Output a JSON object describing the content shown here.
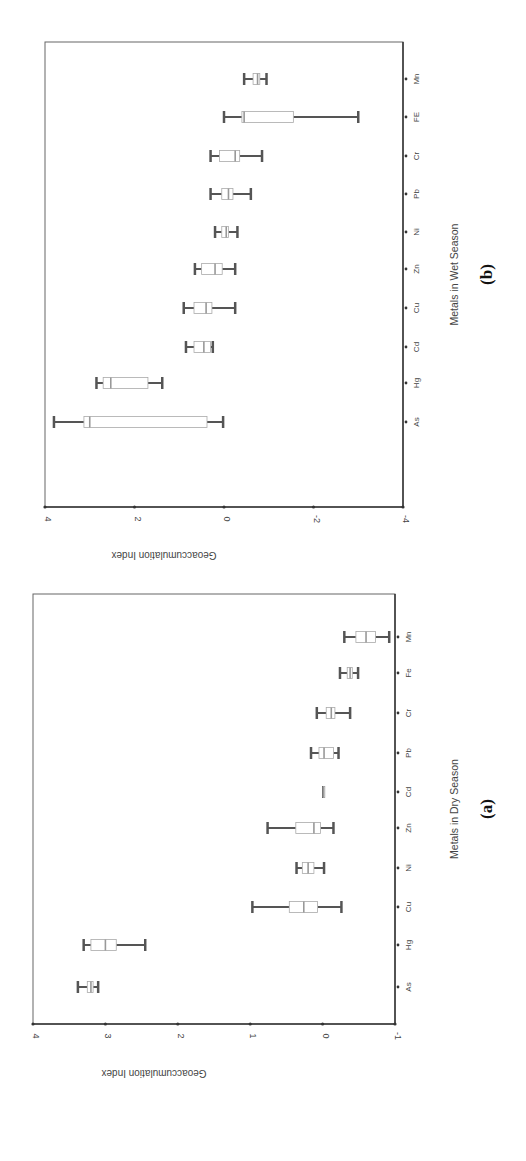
{
  "chart_data": [
    {
      "type": "box",
      "panel_label": "(a)",
      "title": "",
      "xlabel": "Metals in Dry Season",
      "ylabel": "Geoaccumulation Index",
      "ylim": [
        -1,
        4
      ],
      "yticks": [
        4,
        3,
        2,
        1,
        0,
        -1
      ],
      "categories": [
        "As",
        "Hg",
        "Cu",
        "Ni",
        "Zn",
        "Cd",
        "Pb",
        "Cr",
        "Fe",
        "Mn"
      ],
      "boxes": [
        {
          "name": "As",
          "min": 3.1,
          "q1": 3.17,
          "median": 3.2,
          "q3": 3.25,
          "max": 3.38
        },
        {
          "name": "Hg",
          "min": 2.45,
          "q1": 2.85,
          "median": 3.0,
          "q3": 3.2,
          "max": 3.3
        },
        {
          "name": "Cu",
          "min": -0.26,
          "q1": 0.07,
          "median": 0.26,
          "q3": 0.46,
          "max": 0.97
        },
        {
          "name": "Ni",
          "min": -0.02,
          "q1": 0.12,
          "median": 0.2,
          "q3": 0.28,
          "max": 0.36
        },
        {
          "name": "Zn",
          "min": -0.15,
          "q1": 0.03,
          "median": 0.12,
          "q3": 0.37,
          "max": 0.76
        },
        {
          "name": "Cd",
          "min": -0.01,
          "q1": -0.01,
          "median": -0.01,
          "q3": -0.01,
          "max": -0.01
        },
        {
          "name": "Pb",
          "min": -0.22,
          "q1": -0.15,
          "median": -0.02,
          "q3": 0.05,
          "max": 0.16
        },
        {
          "name": "Cr",
          "min": -0.38,
          "q1": -0.17,
          "median": -0.12,
          "q3": -0.05,
          "max": 0.08
        },
        {
          "name": "Fe",
          "min": -0.49,
          "q1": -0.41,
          "median": -0.38,
          "q3": -0.34,
          "max": -0.24
        },
        {
          "name": "Mn",
          "min": -0.92,
          "q1": -0.73,
          "median": -0.6,
          "q3": -0.46,
          "max": -0.3
        }
      ],
      "orientation": "rotated-90",
      "grid": false
    },
    {
      "type": "box",
      "panel_label": "(b)",
      "title": "",
      "xlabel": "Metals in Wet Season",
      "ylabel": "Geoaccumulation Index",
      "ylim": [
        -4,
        4
      ],
      "yticks": [
        4,
        2,
        0,
        -2,
        -4
      ],
      "categories": [
        "As",
        "Hg",
        "Cd",
        "Cu",
        "Zn",
        "Ni",
        "Pb",
        "Cr",
        "FE",
        "Mn"
      ],
      "boxes": [
        {
          "name": "As",
          "min": 0.02,
          "q1": 0.38,
          "median": 3.0,
          "q3": 3.13,
          "max": 3.8
        },
        {
          "name": "Hg",
          "min": 1.38,
          "q1": 1.7,
          "median": 2.53,
          "q3": 2.7,
          "max": 2.85
        },
        {
          "name": "Cd",
          "min": 0.25,
          "q1": 0.3,
          "median": 0.45,
          "q3": 0.67,
          "max": 0.85
        },
        {
          "name": "Cu",
          "min": -0.25,
          "q1": 0.27,
          "median": 0.4,
          "q3": 0.67,
          "max": 0.9
        },
        {
          "name": "Zn",
          "min": -0.25,
          "q1": 0.04,
          "median": 0.2,
          "q3": 0.5,
          "max": 0.65
        },
        {
          "name": "Ni",
          "min": -0.3,
          "q1": -0.1,
          "median": -0.05,
          "q3": 0.05,
          "max": 0.2
        },
        {
          "name": "Pb",
          "min": -0.6,
          "q1": -0.2,
          "median": -0.1,
          "q3": 0.05,
          "max": 0.3
        },
        {
          "name": "Cr",
          "min": -0.85,
          "q1": -0.35,
          "median": -0.25,
          "q3": 0.1,
          "max": 0.3
        },
        {
          "name": "FE",
          "min": -3.0,
          "q1": -1.55,
          "median": -0.45,
          "q3": -0.4,
          "max": 0.0
        },
        {
          "name": "Mn",
          "min": -0.95,
          "q1": -0.8,
          "median": -0.75,
          "q3": -0.65,
          "max": -0.45
        }
      ],
      "orientation": "rotated-90",
      "grid": false
    }
  ],
  "panels": {
    "a": {
      "label": "(a)",
      "xlabel": "Metals in Dry Season",
      "ylabel": "Geoaccumulation Index"
    },
    "b": {
      "label": "(b)",
      "xlabel": "Metals in Wet Season",
      "ylabel": "Geoaccumulation Index"
    }
  },
  "colors": {
    "axis": "#333333",
    "box_stroke": "#aaaaaa",
    "box_fill": "#ffffff",
    "median": "#999999",
    "whisker": "#555555"
  }
}
